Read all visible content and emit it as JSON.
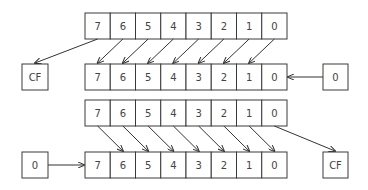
{
  "diagram": {
    "shl": {
      "source_bits": [
        "7",
        "6",
        "5",
        "4",
        "3",
        "2",
        "1",
        "0"
      ],
      "result_bits": [
        "7",
        "6",
        "5",
        "4",
        "3",
        "2",
        "1",
        "0"
      ],
      "carry_label": "CF",
      "fill_label": "0"
    },
    "shr": {
      "source_bits": [
        "7",
        "6",
        "5",
        "4",
        "3",
        "2",
        "1",
        "0"
      ],
      "result_bits": [
        "7",
        "6",
        "5",
        "4",
        "3",
        "2",
        "1",
        "0"
      ],
      "carry_label": "CF",
      "fill_label": "0"
    },
    "colors": {
      "stroke": "#3a3a3a",
      "text": "#444444",
      "background": "#ffffff"
    }
  }
}
